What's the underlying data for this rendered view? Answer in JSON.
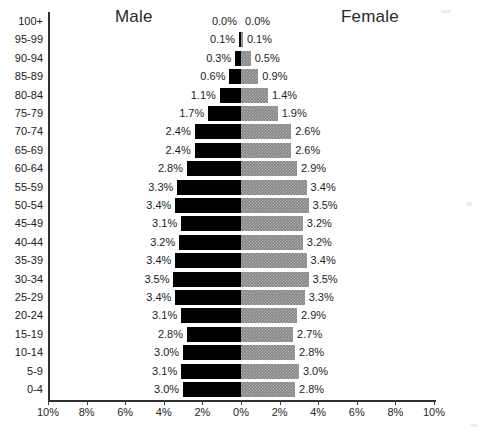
{
  "chart": {
    "male_title": "Male",
    "female_title": "Female",
    "xlabel": "",
    "ylabel": ""
  },
  "axis": {
    "tick_labels": [
      "10%",
      "8%",
      "6%",
      "4%",
      "2%",
      "0%",
      "2%",
      "4%",
      "6%",
      "8%",
      "10%"
    ],
    "tick_values": [
      -10,
      -8,
      -6,
      -4,
      -2,
      0,
      2,
      4,
      6,
      8,
      10
    ]
  },
  "colors": {
    "male_bar": "#000000",
    "female_bar": "#858585",
    "axis": "#2f2f2f",
    "text": "#1d1d1d",
    "background": "#ffffff"
  },
  "chart_data": {
    "type": "bar",
    "subtype": "population-pyramid",
    "xlabel": "",
    "ylabel": "",
    "xlim": [
      -10,
      10
    ],
    "xtick_labels": [
      "10%",
      "8%",
      "6%",
      "4%",
      "2%",
      "0%",
      "2%",
      "4%",
      "6%",
      "8%",
      "10%"
    ],
    "grid": false,
    "legend": [
      "Male",
      "Female"
    ],
    "legend_position": "top",
    "categories": [
      "100+",
      "95-99",
      "90-94",
      "85-89",
      "80-84",
      "75-79",
      "70-74",
      "65-69",
      "60-64",
      "55-59",
      "50-54",
      "45-49",
      "40-44",
      "35-39",
      "30-34",
      "25-29",
      "20-24",
      "15-19",
      "10-14",
      "5-9",
      "0-4"
    ],
    "series": [
      {
        "name": "Male",
        "values": [
          0.0,
          0.1,
          0.3,
          0.6,
          1.1,
          1.7,
          2.4,
          2.4,
          2.8,
          3.3,
          3.4,
          3.1,
          3.2,
          3.4,
          3.5,
          3.4,
          3.1,
          2.8,
          3.0,
          3.1,
          3.0
        ],
        "labels": [
          "0.0%",
          "0.1%",
          "0.3%",
          "0.6%",
          "1.1%",
          "1.7%",
          "2.4%",
          "2.4%",
          "2.8%",
          "3.3%",
          "3.4%",
          "3.1%",
          "3.2%",
          "3.4%",
          "3.5%",
          "3.4%",
          "3.1%",
          "2.8%",
          "3.0%",
          "3.1%",
          "3.0%"
        ]
      },
      {
        "name": "Female",
        "values": [
          0.0,
          0.1,
          0.5,
          0.9,
          1.4,
          1.9,
          2.6,
          2.6,
          2.9,
          3.4,
          3.5,
          3.2,
          3.2,
          3.4,
          3.5,
          3.3,
          2.9,
          2.7,
          2.8,
          3.0,
          2.8
        ],
        "labels": [
          "0.0%",
          "0.1%",
          "0.5%",
          "0.9%",
          "1.4%",
          "1.9%",
          "2.6%",
          "2.6%",
          "2.9%",
          "3.4%",
          "3.5%",
          "3.2%",
          "3.2%",
          "3.4%",
          "3.5%",
          "3.3%",
          "2.9%",
          "2.7%",
          "2.8%",
          "3.0%",
          "2.8%"
        ]
      }
    ]
  }
}
